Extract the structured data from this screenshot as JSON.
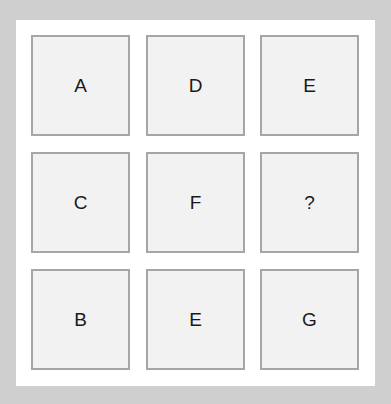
{
  "puzzle": {
    "grid": [
      [
        "A",
        "D",
        "E"
      ],
      [
        "C",
        "F",
        "?"
      ],
      [
        "B",
        "E",
        "G"
      ]
    ]
  }
}
